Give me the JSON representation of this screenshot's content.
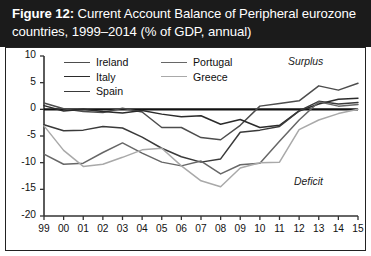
{
  "title": {
    "figure_label": "Figure 12:",
    "text": "Current Account Balance of Peripheral eurozone countries, 1999–2014 (% of GDP, annual)"
  },
  "annotations": {
    "surplus": "Surplus",
    "deficit": "Deficit"
  },
  "colors": {
    "band_background": "#1b1b1b",
    "band_text": "#ffffff",
    "panel_background": "#ffffff",
    "panel_border": "#222222",
    "axis": "#333333",
    "zero_line": "#111111",
    "ireland": "#4d4d4d",
    "italy": "#2b2b2b",
    "spain": "#3a3a3a",
    "portugal": "#676767",
    "greece": "#a9a9a9"
  },
  "chart_data": {
    "type": "line",
    "title": "Current Account Balance of Peripheral eurozone countries, 1999–2014 (% of GDP, annual)",
    "xlabel": "",
    "ylabel": "",
    "grid": false,
    "legend_position": "top-center",
    "ylim": [
      -20,
      10
    ],
    "yticks": [
      10,
      5,
      0,
      -5,
      -10,
      -15,
      -20
    ],
    "ytick_labels": [
      "10",
      "5",
      "0",
      "-5",
      "-10",
      "-15",
      "-20"
    ],
    "x": [
      "99",
      "00",
      "01",
      "02",
      "03",
      "04",
      "05",
      "06",
      "07",
      "08",
      "09",
      "10",
      "11",
      "12",
      "13",
      "14",
      "15"
    ],
    "xtick_labels": [
      "99",
      "00",
      "01",
      "02",
      "03",
      "04",
      "05",
      "06",
      "07",
      "08",
      "09",
      "10",
      "11",
      "12",
      "13",
      "14",
      "15"
    ],
    "zero_reference_line": 0,
    "series": [
      {
        "name": "Ireland",
        "color": "#4d4d4d",
        "values": [
          1.2,
          0.1,
          -0.4,
          -0.6,
          0.2,
          -0.5,
          -3.4,
          -3.4,
          -5.3,
          -5.7,
          -3.0,
          0.6,
          1.1,
          1.6,
          4.4,
          3.6,
          4.9
        ]
      },
      {
        "name": "Italy",
        "color": "#2b2b2b",
        "values": [
          0.7,
          -0.3,
          0.0,
          -0.4,
          -0.7,
          -0.2,
          -0.9,
          -1.4,
          -1.2,
          -2.8,
          -1.9,
          -3.4,
          -3.0,
          -0.3,
          1.0,
          1.9,
          2.1
        ]
      },
      {
        "name": "Spain",
        "color": "#3a3a3a",
        "values": [
          -2.9,
          -4.0,
          -3.9,
          -3.2,
          -3.5,
          -5.2,
          -7.3,
          -8.9,
          -9.9,
          -9.3,
          -4.3,
          -3.9,
          -3.2,
          -0.3,
          1.5,
          1.0,
          1.3
        ]
      },
      {
        "name": "Portugal",
        "color": "#676767",
        "values": [
          -8.4,
          -10.3,
          -10.1,
          -8.1,
          -6.3,
          -8.2,
          -9.9,
          -10.6,
          -9.7,
          -12.1,
          -10.4,
          -10.1,
          -6.0,
          -2.0,
          1.4,
          0.6,
          0.9
        ]
      },
      {
        "name": "Greece",
        "color": "#a9a9a9",
        "values": [
          -3.1,
          -7.7,
          -10.7,
          -10.3,
          -9.0,
          -7.6,
          -7.3,
          -10.6,
          -13.4,
          -14.5,
          -11.0,
          -10.0,
          -9.9,
          -3.8,
          -2.0,
          -0.8,
          0.0
        ]
      }
    ]
  }
}
